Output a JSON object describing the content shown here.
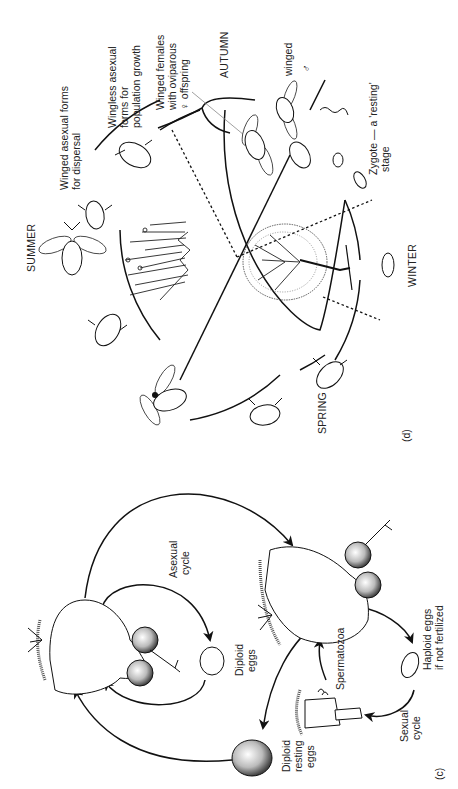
{
  "figure": {
    "orientation": "rotated 90 degrees counter-clockwise",
    "panels": [
      {
        "id": "c",
        "label": "(c)",
        "subject": "rotifer life cycle",
        "labels": {
          "asexual_cycle": [
            "Asexual",
            "cycle"
          ],
          "diploid_eggs": [
            "Diploid",
            "eggs"
          ],
          "diploid_resting_eggs": [
            "Diploid",
            "resting",
            "eggs"
          ],
          "sexual_cycle": [
            "Sexual",
            "cycle"
          ],
          "haploid_eggs": [
            "Haploid eggs",
            "if not fertilized"
          ],
          "spermatozoa": "Spermatozoa"
        }
      },
      {
        "id": "d",
        "label": "(d)",
        "subject": "aphid seasonal life cycle",
        "seasons": {
          "summer": "SUMMER",
          "autumn": "AUTUMN",
          "winter": "WINTER",
          "spring": "SPRING"
        },
        "labels": {
          "winged_asexual": [
            "Winged asexual forms",
            "for dispersal"
          ],
          "wingless_asexual": [
            "Wingless asexual",
            "forms for",
            "population growth"
          ],
          "winged_females": [
            "Winged females",
            "with oviparous",
            "♀   offspring"
          ],
          "winged_male": [
            "winged",
            "♂"
          ],
          "zygote": [
            "Zygote — a 'resting'",
            "stage"
          ]
        }
      }
    ]
  }
}
